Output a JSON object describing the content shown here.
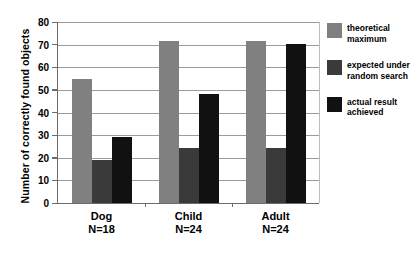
{
  "chart_data": {
    "type": "bar",
    "title": "",
    "xlabel": "",
    "ylabel": "Number of correctly found objects",
    "categories": [
      "Dog",
      "Child",
      "Adult"
    ],
    "category_sublabels": [
      "N=18",
      "N=24",
      "N=24"
    ],
    "series": [
      {
        "name": "theoretical maximum",
        "color": "#808080",
        "values": [
          55,
          71.5,
          71.5
        ]
      },
      {
        "name": "expected under random search",
        "color": "#3a3a3a",
        "values": [
          19,
          24.5,
          24.5
        ]
      },
      {
        "name": "actual result achieved",
        "color": "#111111",
        "values": [
          29,
          48,
          70.5
        ]
      }
    ],
    "ylim": [
      0,
      80
    ],
    "ytick_values": [
      0,
      10,
      20,
      30,
      40,
      50,
      60,
      70,
      80
    ],
    "ytick_labels": [
      "0",
      "10",
      "20",
      "30",
      "40",
      "50",
      "60",
      "70",
      "80"
    ],
    "grid": true,
    "legend_position": "right"
  },
  "legend": {
    "items": [
      {
        "label_line1": "theoretical",
        "label_line2": "maximum"
      },
      {
        "label_line1": "expected under",
        "label_line2": "random search"
      },
      {
        "label_line1": "actual result",
        "label_line2": "achieved"
      }
    ]
  }
}
